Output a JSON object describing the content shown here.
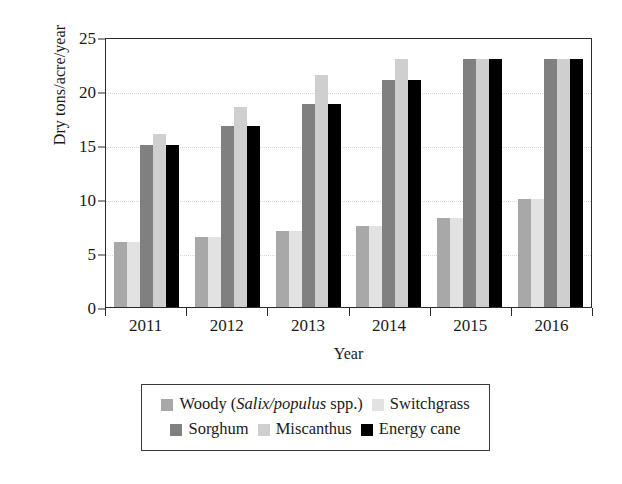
{
  "chart_data": {
    "type": "bar",
    "title": "",
    "subtitle": "",
    "xlabel": "Year",
    "ylabel": "Dry tons/acre/year",
    "categories": [
      "2011",
      "2012",
      "2013",
      "2014",
      "2015",
      "2016"
    ],
    "ylim": [
      0,
      25
    ],
    "yticks": [
      0,
      5,
      10,
      15,
      20,
      25
    ],
    "grid": "horizontal-dotted",
    "legend_position": "below-plot",
    "series": [
      {
        "name": "Woody (Salix/populus spp.)",
        "name_prefix": "Woody (",
        "name_italic": "Salix/populus",
        "name_suffix": " spp.)",
        "color": "#a8a8a8",
        "values": [
          6.0,
          6.5,
          7.0,
          7.5,
          8.2,
          10.0
        ]
      },
      {
        "name": "Switchgrass",
        "color": "#e2e2e2",
        "values": [
          6.0,
          6.5,
          7.0,
          7.5,
          8.2,
          10.0
        ]
      },
      {
        "name": "Sorghum",
        "color": "#808080",
        "values": [
          15.0,
          16.8,
          18.8,
          21.0,
          23.0,
          23.0
        ]
      },
      {
        "name": "Miscanthus",
        "color": "#cfcfcf",
        "values": [
          16.0,
          18.5,
          21.5,
          23.0,
          23.0,
          23.0
        ]
      },
      {
        "name": "Energy cane",
        "color": "#000000",
        "values": [
          15.0,
          16.8,
          18.8,
          21.0,
          23.0,
          23.0
        ]
      }
    ]
  },
  "axes": {
    "frame_color": "#2b2b2b",
    "gridline_color": "#d8d8d8"
  },
  "legend": {
    "border_color": "#3a3a3a",
    "row1": [
      0,
      1
    ],
    "row2": [
      2,
      3,
      4
    ]
  }
}
